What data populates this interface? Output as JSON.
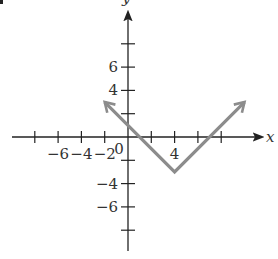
{
  "chart_data": {
    "type": "line",
    "title": "",
    "xlabel": "x",
    "ylabel": "y",
    "function": "y = |x - 4| - 3",
    "series": [
      {
        "name": "absolute value graph",
        "color": "#8c8c8c",
        "points": [
          [
            -2,
            3
          ],
          [
            4,
            -3
          ],
          [
            10,
            3
          ]
        ],
        "arrows": "both ends"
      }
    ],
    "vertex": [
      4,
      -3
    ],
    "xlim": [
      -10,
      11
    ],
    "ylim": [
      -10,
      11
    ],
    "x_ticks": [
      -8,
      -6,
      -4,
      -2,
      2,
      4,
      6,
      8
    ],
    "y_ticks": [
      -8,
      -6,
      -4,
      -2,
      2,
      4,
      6,
      8
    ],
    "x_tick_labels": [
      {
        "value": -6,
        "text": "−6"
      },
      {
        "value": -4,
        "text": "−4"
      },
      {
        "value": -2,
        "text": "−2"
      },
      {
        "value": 4,
        "text": "4"
      }
    ],
    "y_tick_labels": [
      {
        "value": 6,
        "text": "6"
      },
      {
        "value": 4,
        "text": "4"
      },
      {
        "value": -4,
        "text": "−4"
      },
      {
        "value": -6,
        "text": "−6"
      }
    ],
    "origin_label": "0",
    "grid": false,
    "legend": null
  },
  "colors": {
    "axis": "#222222",
    "curve": "#8c8c8c",
    "text": "#333333"
  }
}
